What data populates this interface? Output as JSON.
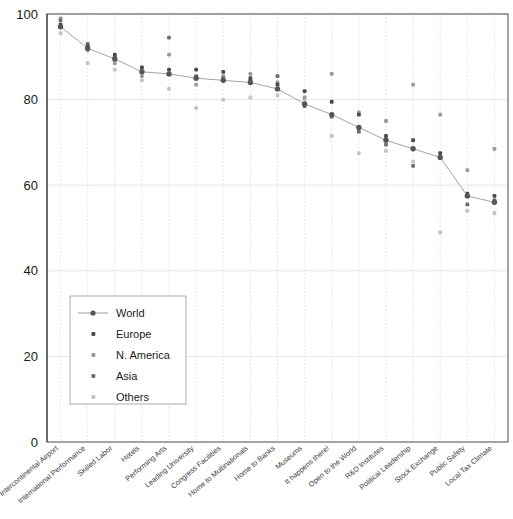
{
  "chart_data": {
    "type": "scatter",
    "title": "",
    "xlabel": "",
    "ylabel": "",
    "ylim": [
      0,
      100
    ],
    "yticks": [
      0,
      20,
      40,
      60,
      80,
      100
    ],
    "ytick_labels": [
      "0",
      "20",
      "40",
      "60",
      "80",
      "100"
    ],
    "grid": true,
    "legend_position": "lower-left-inside",
    "categories": [
      "Intercontinental Airport",
      "International Performance",
      "Skilled Labor",
      "Hotels",
      "Performing Arts",
      "Leading University",
      "Congress Facilities",
      "Home to Multinationals",
      "Home to Banks",
      "Museums",
      "It happens there!",
      "Open to the World",
      "R&D Institutes",
      "Political Leadership",
      "Stock Exchange",
      "Public Safety",
      "Local Tax Climate"
    ],
    "legend_entries": [
      {
        "name": "World",
        "marker": "line-dot",
        "color": "#555555"
      },
      {
        "name": "Europe",
        "marker": "dot",
        "color": "#4a4a4a"
      },
      {
        "name": "N. America",
        "marker": "dot",
        "color": "#9a9a9a"
      },
      {
        "name": "Asia",
        "marker": "dot",
        "color": "#6e6e6e"
      },
      {
        "name": "Others",
        "marker": "dot",
        "color": "#c4c4c4"
      }
    ],
    "series": [
      {
        "name": "World",
        "color": "#555555",
        "marker": "line-dot",
        "values": [
          97.0,
          92.0,
          89.5,
          86.5,
          86.0,
          85.0,
          84.5,
          84.0,
          82.5,
          79.0,
          76.5,
          73.5,
          70.5,
          68.5,
          66.5,
          57.5,
          56.0
        ]
      },
      {
        "name": "Europe",
        "color": "#4a4a4a",
        "marker": "dot",
        "values": [
          97.5,
          92.5,
          90.5,
          87.5,
          87.0,
          87.0,
          86.5,
          85.0,
          83.5,
          82.0,
          79.5,
          76.5,
          71.5,
          70.5,
          67.5,
          58.0,
          57.5
        ]
      },
      {
        "name": "N. America",
        "color": "#9a9a9a",
        "marker": "dot",
        "values": [
          99.0,
          91.5,
          88.5,
          85.5,
          90.5,
          83.5,
          85.5,
          86.0,
          84.0,
          80.5,
          86.0,
          77.0,
          75.0,
          83.5,
          76.5,
          63.5,
          68.5
        ]
      },
      {
        "name": "Asia",
        "color": "#6e6e6e",
        "marker": "dot",
        "values": [
          98.5,
          93.0,
          90.0,
          86.5,
          94.5,
          85.5,
          85.0,
          84.5,
          85.5,
          78.5,
          76.0,
          72.5,
          69.5,
          64.5,
          66.5,
          55.5,
          56.5
        ]
      },
      {
        "name": "Others",
        "color": "#c4c4c4",
        "marker": "dot",
        "values": [
          95.5,
          88.5,
          87.0,
          84.5,
          82.5,
          78.0,
          80.0,
          80.5,
          81.0,
          80.0,
          71.5,
          67.5,
          68.0,
          65.5,
          49.0,
          54.0,
          53.5
        ]
      }
    ]
  },
  "plot": {
    "y_axis_name": "y-axis",
    "x_axis_name": "x-axis"
  }
}
